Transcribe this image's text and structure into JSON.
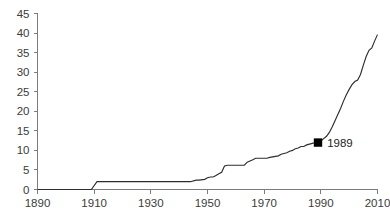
{
  "chart_data": {
    "type": "line",
    "title": "",
    "subtitle": "",
    "xlabel": "",
    "ylabel": "",
    "xlim": [
      1890,
      2010
    ],
    "ylim": [
      0,
      45
    ],
    "grid": false,
    "legend": null,
    "x_ticks": [
      1890,
      1910,
      1930,
      1950,
      1970,
      1990,
      2010
    ],
    "x_tick_labels": [
      "1890",
      "1910",
      "1930",
      "1950",
      "1970",
      "1990",
      "2010"
    ],
    "y_ticks": [
      0,
      5,
      10,
      15,
      20,
      25,
      30,
      35,
      40,
      45
    ],
    "y_tick_labels": [
      "0",
      "5",
      "10",
      "15",
      "20",
      "25",
      "30",
      "35",
      "40",
      "45"
    ],
    "series": [
      {
        "name": "cumulative",
        "x": [
          1890,
          1909,
          1911,
          1930,
          1944,
          1946,
          1947,
          1949,
          1950,
          1951,
          1952,
          1953,
          1954,
          1955,
          1956,
          1957,
          1963,
          1964,
          1966,
          1967,
          1968,
          1971,
          1972,
          1975,
          1976,
          1978,
          1979,
          1980,
          1981,
          1982,
          1983,
          1984,
          1985,
          1986,
          1987,
          1988,
          1989,
          1990,
          1991,
          1992,
          1993,
          1994,
          1995,
          1996,
          1997,
          1998,
          1999,
          2000,
          2001,
          2002,
          2003,
          2004,
          2005,
          2006,
          2007,
          2008,
          2009,
          2010
        ],
        "y": [
          0,
          0,
          2,
          2,
          2,
          2.4,
          2.4,
          2.6,
          3,
          3.2,
          3.2,
          3.6,
          4,
          4.4,
          6,
          6.2,
          6.2,
          7,
          7.6,
          8,
          8,
          8,
          8.2,
          8.6,
          9,
          9.4,
          9.8,
          10,
          10.4,
          10.6,
          11,
          11,
          11.4,
          11.6,
          11.8,
          12,
          12,
          12.4,
          13,
          13.6,
          14.6,
          16,
          17.6,
          19.2,
          20.8,
          22.6,
          24.2,
          25.6,
          26.8,
          27.6,
          28,
          29.4,
          31.8,
          34,
          35.6,
          36.2,
          38,
          39.6
        ]
      }
    ],
    "annotations": [
      {
        "label": "1989",
        "marker": "filled-square",
        "marker_color": "#000000",
        "x": 1989,
        "y": 12
      }
    ]
  },
  "colors": {
    "line": "#2e2e2e",
    "axis": "#7c7c7c",
    "text": "#3b3b3b",
    "marker": "#000000",
    "background": "#ffffff"
  }
}
